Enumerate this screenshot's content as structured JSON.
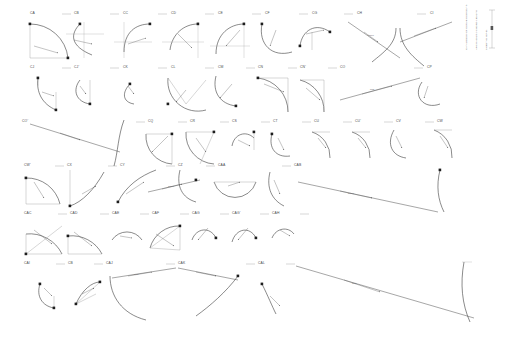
{
  "sheet": {
    "title": "Arc geometry callout sheet",
    "background": "#ffffff",
    "line_color": "#2b2b2b",
    "label_color": "#4a4a4a",
    "width": 506,
    "height": 344
  },
  "legend": {
    "columns": [
      "CATALOGUE OF CURVE ELEMENTS",
      "ARC RADIUS / CHORD LENGTH",
      "SHEET 01 OF 01"
    ]
  },
  "rows": [
    {
      "row": 1,
      "labels": [
        "CA",
        "CB",
        "CC",
        "CD",
        "CE",
        "CF",
        "CG",
        "CH",
        "CI"
      ]
    },
    {
      "row": 2,
      "labels": [
        "CJ",
        "CJ'",
        "CK",
        "CL",
        "CM",
        "CN",
        "CN'",
        "CO",
        "CP"
      ]
    },
    {
      "row": 3,
      "labels": [
        "CO'",
        "CQ",
        "CR",
        "CS",
        "CT",
        "CU",
        "CU'",
        "CV",
        "CW"
      ]
    },
    {
      "row": 4,
      "labels": [
        "CW'",
        "CX",
        "CY",
        "CZ",
        "CAA",
        "CAB"
      ]
    },
    {
      "row": 5,
      "labels": [
        "CAC",
        "CAD",
        "CAE",
        "CAF",
        "CAG",
        "CAG'",
        "CAH"
      ]
    },
    {
      "row": 6,
      "labels": [
        "CAI",
        "CB",
        "CAJ",
        "CAK",
        "CAL"
      ]
    }
  ],
  "dimensions": {
    "d1": "R100",
    "d2": "R85",
    "d3": "R120",
    "d4": "R60",
    "d5": "R150"
  }
}
